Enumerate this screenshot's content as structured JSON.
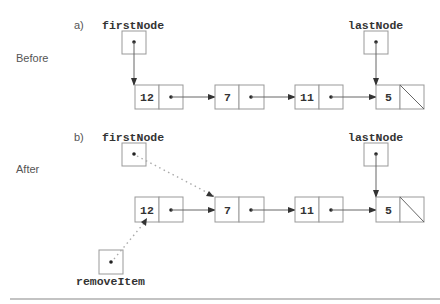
{
  "diagram": {
    "panels": [
      {
        "id": "a",
        "marker": "a)",
        "side_label": "Before",
        "first_pointer": "firstNode",
        "last_pointer": "lastNode",
        "nodes": [
          {
            "value": "12",
            "next": "pointer"
          },
          {
            "value": "7",
            "next": "pointer"
          },
          {
            "value": "11",
            "next": "pointer"
          },
          {
            "value": "5",
            "next": "null"
          }
        ],
        "firstNode_points_to": "12",
        "lastNode_points_to": "5"
      },
      {
        "id": "b",
        "marker": "b)",
        "side_label": "After",
        "first_pointer": "firstNode",
        "last_pointer": "lastNode",
        "temp_pointer": "removeItem",
        "nodes": [
          {
            "value": "12",
            "next": "pointer"
          },
          {
            "value": "7",
            "next": "pointer"
          },
          {
            "value": "11",
            "next": "pointer"
          },
          {
            "value": "5",
            "next": "null"
          }
        ],
        "firstNode_points_to": "7",
        "removeItem_points_to": "12",
        "lastNode_points_to": "5"
      }
    ]
  },
  "colors": {
    "box_stroke": "#999999",
    "arrow": "#666666",
    "dotted_arrow": "#aaaaaa",
    "text": "#333333"
  }
}
